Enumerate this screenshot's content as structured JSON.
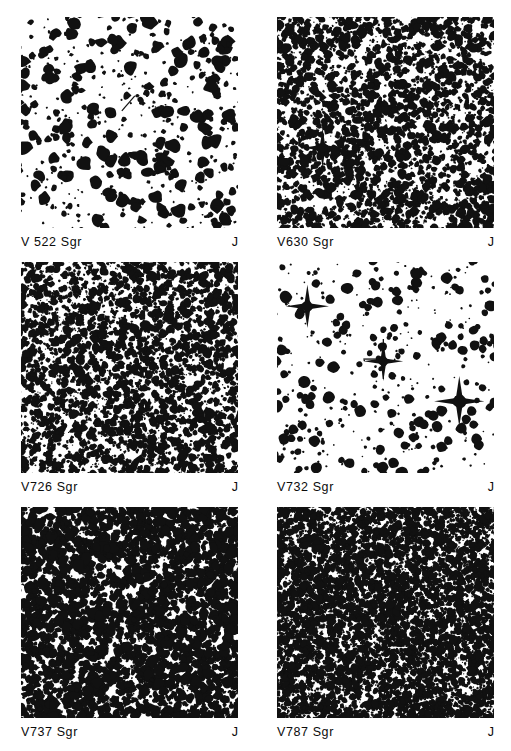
{
  "figure": {
    "kind": "astronomical-finding-charts",
    "background_color": "#ffffff",
    "ink_color": "#111111",
    "columns": 2,
    "rows": 3,
    "panel_width_px": 217,
    "panel_height_px": 211
  },
  "panels": [
    {
      "id": "panel-v522-sgr",
      "star_name": "V 522  Sgr",
      "band": "J",
      "field_style": "blobby-resolved",
      "seed": 1522,
      "star_count": 560,
      "mean_radius_px": 2.9,
      "density": "moderate",
      "has_marker": true,
      "marker_type": "tick",
      "marker_x_pct": 46,
      "marker_y_pct": 45
    },
    {
      "id": "panel-v630-sgr",
      "star_name": "V630  Sgr",
      "band": "J",
      "field_style": "mottled-crowded",
      "seed": 630,
      "star_count": 1500,
      "mean_radius_px": 2.1,
      "density": "high",
      "has_marker": false,
      "bright_stars": [
        {
          "x_pct": 21,
          "y_pct": 62,
          "radius_px": 5.5,
          "spikes": true
        }
      ]
    },
    {
      "id": "panel-v726-sgr",
      "star_name": "V726  Sgr",
      "band": "J",
      "field_style": "mottled-crowded",
      "seed": 726,
      "star_count": 1750,
      "mean_radius_px": 2.0,
      "density": "high",
      "has_marker": false
    },
    {
      "id": "panel-v732-sgr",
      "star_name": "V732  Sgr",
      "band": "J",
      "field_style": "sparse-resolved",
      "seed": 732,
      "star_count": 420,
      "mean_radius_px": 2.4,
      "density": "low",
      "has_marker": true,
      "marker_type": "crosshair",
      "marker_x_pct": 49,
      "marker_y_pct": 46,
      "bright_stars": [
        {
          "x_pct": 14,
          "y_pct": 21,
          "radius_px": 6.0,
          "spikes": true
        },
        {
          "x_pct": 49,
          "y_pct": 47,
          "radius_px": 5.5,
          "spikes": true
        },
        {
          "x_pct": 84,
          "y_pct": 66,
          "radius_px": 7.0,
          "spikes": true
        }
      ]
    },
    {
      "id": "panel-v737-sgr",
      "star_name": "V737  Sgr",
      "band": "J",
      "field_style": "mottled-saturated",
      "seed": 737,
      "star_count": 2100,
      "mean_radius_px": 2.4,
      "density": "very-high",
      "has_marker": true,
      "marker_type": "tick",
      "marker_x_pct": 47,
      "marker_y_pct": 50
    },
    {
      "id": "panel-v787-sgr",
      "star_name": "V787  Sgr",
      "band": "J",
      "field_style": "fine-grain-saturated",
      "seed": 787,
      "star_count": 3200,
      "mean_radius_px": 1.8,
      "density": "extreme",
      "has_marker": false
    }
  ]
}
